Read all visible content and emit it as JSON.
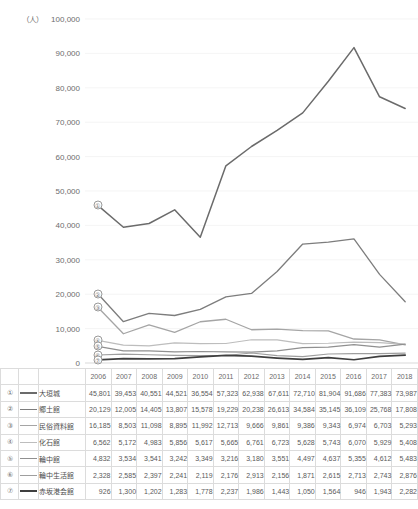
{
  "axis": {
    "unit": "（人）",
    "y_ticks": [
      "100,000",
      "90,000",
      "80,000",
      "70,000",
      "60,000",
      "50,000",
      "40,000",
      "30,000",
      "20,000",
      "10,000",
      "0"
    ],
    "y_min": 0,
    "y_max": 100000,
    "y_step": 10000
  },
  "table": {
    "header_years": [
      "2006",
      "2007",
      "2008",
      "2009",
      "2010",
      "2011",
      "2012",
      "2013",
      "2014",
      "2015",
      "2016",
      "2017",
      "2018"
    ],
    "rows": [
      {
        "index": "①",
        "name": "大垣城",
        "color": "#6b6b6b",
        "width": 1.5,
        "values": [
          "45,801",
          "39,453",
          "40,551",
          "44,521",
          "36,554",
          "57,323",
          "62,938",
          "67,611",
          "72,710",
          "81,904",
          "91,686",
          "77,383",
          "73,987"
        ]
      },
      {
        "index": "②",
        "name": "郷土館",
        "color": "#7d7d7d",
        "width": 1.3,
        "values": [
          "20,129",
          "12,005",
          "14,405",
          "13,807",
          "15,578",
          "19,229",
          "20,238",
          "26,613",
          "34,584",
          "35,145",
          "36,109",
          "25,768",
          "17,808"
        ]
      },
      {
        "index": "③",
        "name": "民俗資料館",
        "color": "#a5a5a5",
        "width": 1.3,
        "values": [
          "16,185",
          "8,503",
          "11,098",
          "8,895",
          "11,992",
          "12,713",
          "9,666",
          "9,861",
          "9,386",
          "9,343",
          "6,974",
          "6,703",
          "5,293"
        ]
      },
      {
        "index": "④",
        "name": "化石館",
        "color": "#bdbdbd",
        "width": 1.2,
        "values": [
          "6,562",
          "5,172",
          "4,983",
          "5,856",
          "5,617",
          "5,665",
          "6,761",
          "6,723",
          "5,628",
          "5,743",
          "6,070",
          "5,929",
          "5,408"
        ]
      },
      {
        "index": "⑤",
        "name": "輪中館",
        "color": "#909090",
        "width": 1.2,
        "values": [
          "4,832",
          "3,534",
          "3,541",
          "3,242",
          "3,349",
          "3,216",
          "3,180",
          "3,551",
          "4,497",
          "4,637",
          "5,355",
          "4,612",
          "5,483"
        ]
      },
      {
        "index": "⑥",
        "name": "輪中生活館",
        "color": "#9e9e9e",
        "width": 1.2,
        "values": [
          "2,328",
          "2,585",
          "2,397",
          "2,241",
          "2,119",
          "2,176",
          "2,913",
          "2,156",
          "1,871",
          "2,615",
          "2,713",
          "2,743",
          "2,876"
        ]
      },
      {
        "index": "⑦",
        "name": "赤坂港会館",
        "color": "#3f3f3f",
        "width": 1.7,
        "values": [
          "926",
          "1,300",
          "1,202",
          "1,283",
          "1,778",
          "2,237",
          "1,986",
          "1,443",
          "1,050",
          "1,564",
          "946",
          "1,943",
          "2,282"
        ]
      }
    ]
  },
  "chart_data": {
    "type": "line",
    "title": "",
    "xlabel": "",
    "ylabel": "（人）",
    "ylim": [
      0,
      100000
    ],
    "grid": true,
    "legend": "table-below",
    "x": [
      2006,
      2007,
      2008,
      2009,
      2010,
      2011,
      2012,
      2013,
      2014,
      2015,
      2016,
      2017,
      2018
    ],
    "series": [
      {
        "name": "大垣城",
        "index": "①",
        "color": "#6b6b6b",
        "values": [
          45801,
          39453,
          40551,
          44521,
          36554,
          57323,
          62938,
          67611,
          72710,
          81904,
          91686,
          77383,
          73987
        ]
      },
      {
        "name": "郷土館",
        "index": "②",
        "color": "#7d7d7d",
        "values": [
          20129,
          12005,
          14405,
          13807,
          15578,
          19229,
          20238,
          26613,
          34584,
          35145,
          36109,
          25768,
          17808
        ]
      },
      {
        "name": "民俗資料館",
        "index": "③",
        "color": "#a5a5a5",
        "values": [
          16185,
          8503,
          11098,
          8895,
          11992,
          12713,
          9666,
          9861,
          9386,
          9343,
          6974,
          6703,
          5293
        ]
      },
      {
        "name": "化石館",
        "index": "④",
        "color": "#bdbdbd",
        "values": [
          6562,
          5172,
          4983,
          5856,
          5617,
          5665,
          6761,
          6723,
          5628,
          5743,
          6070,
          5929,
          5408
        ]
      },
      {
        "name": "輪中館",
        "index": "⑤",
        "color": "#909090",
        "values": [
          4832,
          3534,
          3541,
          3242,
          3349,
          3216,
          3180,
          3551,
          4497,
          4637,
          5355,
          4612,
          5483
        ]
      },
      {
        "name": "輪中生活館",
        "index": "⑥",
        "color": "#9e9e9e",
        "values": [
          2328,
          2585,
          2397,
          2241,
          2119,
          2176,
          2913,
          2156,
          1871,
          2615,
          2713,
          2743,
          2876
        ]
      },
      {
        "name": "赤坂港会館",
        "index": "⑦",
        "color": "#3f3f3f",
        "values": [
          926,
          1300,
          1202,
          1283,
          1778,
          2237,
          1986,
          1443,
          1050,
          1564,
          946,
          1943,
          2282
        ]
      }
    ]
  }
}
